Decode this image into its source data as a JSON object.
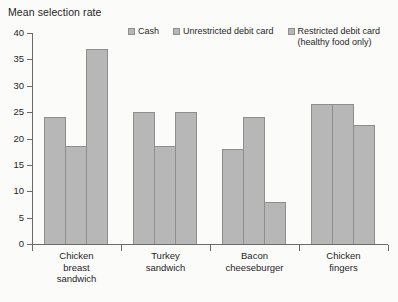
{
  "chart_data": {
    "type": "bar",
    "title": "Mean selection rate",
    "xlabel": "",
    "ylabel": "Mean selection rate",
    "ylim": [
      0,
      40
    ],
    "yticks": [
      0,
      5,
      10,
      15,
      20,
      25,
      30,
      35,
      40
    ],
    "grid": false,
    "legend_position": "top",
    "bar_color": "#b7b7b7",
    "bar_border_color": "#8e8e8e",
    "axis_color": "#6a6a6a",
    "categories": [
      "Chicken\nbreast\nsandwich",
      "Turkey\nsandwich",
      "Bacon\ncheeseburger",
      "Chicken\nfingers"
    ],
    "series": [
      {
        "name": "Cash",
        "values": [
          24,
          25,
          18,
          26.5
        ]
      },
      {
        "name": "Unrestricted debit card",
        "values": [
          18.5,
          18.5,
          24,
          26.5
        ]
      },
      {
        "name": "Restricted debit card\n(healthy food only)",
        "values": [
          37,
          25,
          8,
          22.5
        ]
      }
    ]
  }
}
